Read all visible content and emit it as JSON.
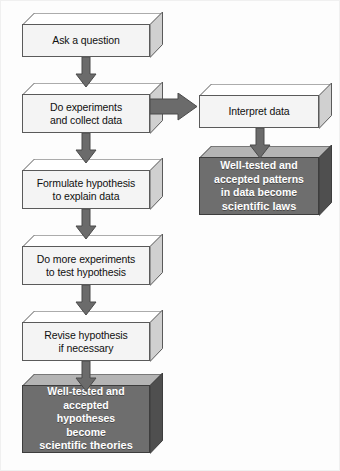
{
  "diagram": {
    "colors": {
      "light_box_fill": "#f4f4f4",
      "light_box_top": "#ffffff",
      "light_box_side": "#d0d0d0",
      "dark_box_fill": "#6e6e6e",
      "dark_box_top": "#b4b4b4",
      "dark_box_side": "#4f4f4f",
      "arrow_fill": "#6b6b6b",
      "outline": "#5a5a5a",
      "background": "#fdfdfd",
      "dark_text": "#101010",
      "light_text": "#ffffff"
    },
    "nodes": [
      {
        "id": "ask",
        "style": "light",
        "lines": [
          "Ask a question"
        ]
      },
      {
        "id": "experiments",
        "style": "light",
        "lines": [
          "Do experiments",
          "and collect data"
        ]
      },
      {
        "id": "formulate",
        "style": "light",
        "lines": [
          "Formulate hypothesis",
          "to explain data"
        ]
      },
      {
        "id": "more-experiments",
        "style": "light",
        "lines": [
          "Do more experiments",
          "to test hypothesis"
        ]
      },
      {
        "id": "revise",
        "style": "light",
        "lines": [
          "Revise hypothesis",
          "if necessary"
        ]
      },
      {
        "id": "theories",
        "style": "dark",
        "lines": [
          "Well-tested and",
          "accepted",
          "hypotheses",
          "become"
        ],
        "emphasis": "scientific theories"
      },
      {
        "id": "interpret",
        "style": "light",
        "lines": [
          "Interpret data"
        ]
      },
      {
        "id": "laws",
        "style": "dark",
        "lines": [
          "Well-tested and",
          "accepted patterns",
          "in data become"
        ],
        "emphasis": "scientific laws"
      }
    ],
    "edges": [
      {
        "from": "ask",
        "to": "experiments",
        "direction": "down"
      },
      {
        "from": "experiments",
        "to": "formulate",
        "direction": "down"
      },
      {
        "from": "formulate",
        "to": "more-experiments",
        "direction": "down"
      },
      {
        "from": "more-experiments",
        "to": "revise",
        "direction": "down"
      },
      {
        "from": "revise",
        "to": "theories",
        "direction": "down"
      },
      {
        "from": "experiments",
        "to": "interpret",
        "direction": "right"
      },
      {
        "from": "interpret",
        "to": "laws",
        "direction": "down"
      }
    ]
  }
}
